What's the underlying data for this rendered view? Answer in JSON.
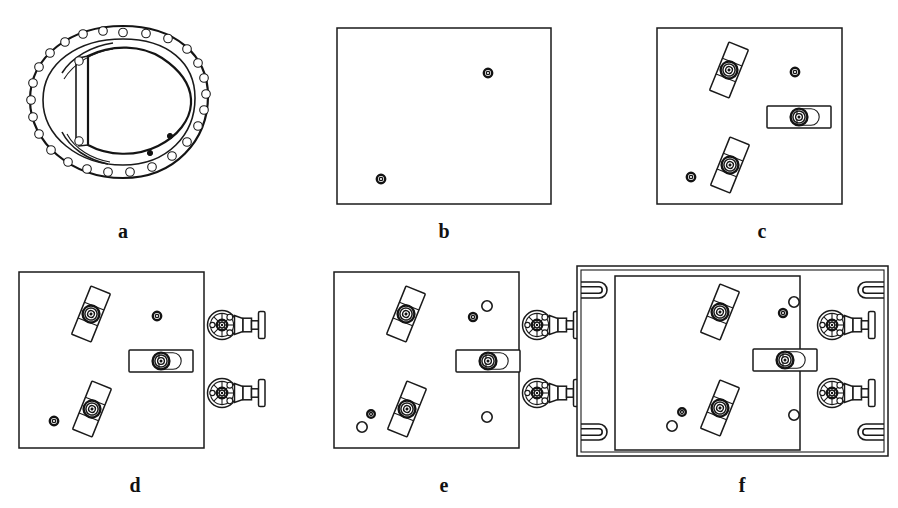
{
  "figure": {
    "background_color": "#ffffff",
    "line_color": "#1a1a1a",
    "width": 898,
    "height": 508
  },
  "panels": [
    {
      "id": "a",
      "label": "a",
      "caption_x": 123,
      "caption_y": 238,
      "type": "oval-flange-cover",
      "description": "Oval bolted flange ring with inner D-shaped cover plate",
      "bolt_hole_count": 28,
      "inner_small_holes": 2
    },
    {
      "id": "b",
      "label": "b",
      "caption_x": 444,
      "caption_y": 238,
      "type": "plain-plate",
      "description": "Plain square plate with two small pilot holes",
      "plate": {
        "x": 337,
        "y": 28,
        "w": 214,
        "h": 176
      },
      "holes": [
        {
          "cx": 488,
          "cy": 73,
          "r": 4.2,
          "style": "solid-ring"
        },
        {
          "cx": 381,
          "cy": 179,
          "r": 4.2,
          "style": "solid-ring"
        }
      ]
    },
    {
      "id": "c",
      "label": "c",
      "caption_x": 762,
      "caption_y": 238,
      "type": "plate-with-clamps",
      "description": "Plate with three bolted clamp bars added",
      "plate": {
        "x": 657,
        "y": 28,
        "w": 185,
        "h": 176
      },
      "clamps": 3,
      "holes": 2
    },
    {
      "id": "d",
      "label": "d",
      "caption_x": 135,
      "caption_y": 492,
      "type": "plate-with-clamps-and-valves",
      "description": "Plate with clamps plus two flanged handwheel valves on right edge",
      "plate": {
        "x": 19,
        "y": 272,
        "w": 185,
        "h": 176
      },
      "clamps": 3,
      "valves": 2
    },
    {
      "id": "e",
      "label": "e",
      "caption_x": 444,
      "caption_y": 492,
      "type": "plate-with-extra-holes",
      "description": "Same as d with additional open drilled holes",
      "plate": {
        "x": 334,
        "y": 272,
        "w": 185,
        "h": 176
      },
      "clamps": 3,
      "valves": 2,
      "extra_holes": 5
    },
    {
      "id": "f",
      "label": "f",
      "caption_x": 742,
      "caption_y": 492,
      "type": "framed-assembly",
      "description": "Complete assembly inside outer frame with four U-slot corner cutouts",
      "outer_frame": {
        "x": 577,
        "y": 266,
        "w": 311,
        "h": 190
      },
      "plate": {
        "x": 615,
        "y": 276,
        "w": 185,
        "h": 174
      },
      "clamps": 3,
      "valves": 2,
      "corner_slots": 4
    }
  ]
}
